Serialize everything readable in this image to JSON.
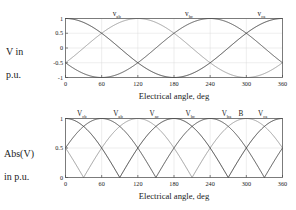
{
  "figure": {
    "background": "#ffffff",
    "panels": [
      "top",
      "bottom"
    ]
  },
  "top_panel": {
    "ylabel_line1": "V in",
    "ylabel_line2": "p.u.",
    "xlabel": "Electrical angle, deg",
    "curve_labels": [
      {
        "base": "v",
        "sub": "ab",
        "x_deg": 85
      },
      {
        "base": "v",
        "sub": "bc",
        "x_deg": 205
      },
      {
        "base": "v",
        "sub": "ca",
        "x_deg": 325
      }
    ]
  },
  "bottom_panel": {
    "ylabel_line1": "Abs(V)",
    "ylabel_line2": "in p.u.",
    "xlabel": "Electrical angle, deg",
    "curve_labels": [
      {
        "base": "V",
        "sub": "cb",
        "x_deg": 27
      },
      {
        "base": "V",
        "sub": "ab",
        "x_deg": 87
      },
      {
        "base": "V",
        "sub": "ac",
        "x_deg": 147
      },
      {
        "base": "V",
        "sub": "bc",
        "x_deg": 207
      },
      {
        "base": "V",
        "sub": "ba",
        "x_deg": 267
      },
      {
        "base": "B",
        "sub": "",
        "x_deg": 291
      },
      {
        "base": "V",
        "sub": "ca",
        "x_deg": 327
      }
    ]
  },
  "chart_data": [
    {
      "type": "line",
      "panel": "top",
      "title": "",
      "xlabel": "Electrical angle, deg",
      "ylabel": "V in p.u.",
      "xlim": [
        0,
        360
      ],
      "ylim": [
        -1,
        1
      ],
      "xticks": [
        0,
        60,
        120,
        180,
        240,
        300,
        360
      ],
      "xticklabels": [
        "0",
        "60",
        "120",
        "180",
        "240",
        "300",
        "360"
      ],
      "yticks": [
        -1,
        -0.5,
        0,
        0.5,
        1
      ],
      "yticklabels": [
        "-1",
        "-0.5",
        "0",
        "0.5",
        "1"
      ],
      "grid": true,
      "legend": "inline-curve-labels",
      "series": [
        {
          "name": "v_ab",
          "color": "#9a9a9a",
          "form": "sin(x-30)",
          "amplitude": 1,
          "phase_deg": -30,
          "peak_deg": 120,
          "value_at_0": -0.5
        },
        {
          "name": "v_bc",
          "color": "#4d4d4d",
          "form": "sin(x-150)",
          "amplitude": 1,
          "phase_deg": -150,
          "peak_deg": 240,
          "value_at_0": -0.866
        },
        {
          "name": "v_ca",
          "color": "#3a3a3a",
          "form": "sin(x+90)",
          "amplitude": 1,
          "phase_deg": 90,
          "peak_deg": 0,
          "value_at_0": 0.866
        }
      ]
    },
    {
      "type": "line",
      "panel": "bottom",
      "title": "",
      "xlabel": "Electrical angle, deg",
      "ylabel": "Abs(V) in p.u.",
      "xlim": [
        0,
        360
      ],
      "ylim": [
        0,
        1
      ],
      "xticks": [
        0,
        60,
        120,
        180,
        240,
        300,
        360
      ],
      "xticklabels": [
        "0",
        "60",
        "120",
        "180",
        "240",
        "300",
        "360"
      ],
      "yticks": [
        0,
        0.5,
        1
      ],
      "yticklabels": [
        "0",
        "0.5",
        "1"
      ],
      "grid": true,
      "legend": "inline-curve-labels",
      "series": [
        {
          "name": "|v_ab|",
          "color": "#9a9a9a",
          "form": "abs(sin(x-30))",
          "amplitude": 1,
          "phase_deg": -30,
          "zeros_deg": [
            30,
            210
          ],
          "peaks_deg": [
            120,
            300
          ]
        },
        {
          "name": "|v_bc|",
          "color": "#4d4d4d",
          "form": "abs(sin(x-150))",
          "amplitude": 1,
          "phase_deg": -150,
          "zeros_deg": [
            150,
            330
          ],
          "peaks_deg": [
            60,
            240
          ]
        },
        {
          "name": "|v_ca|",
          "color": "#3a3a3a",
          "form": "abs(sin(x+90))",
          "amplitude": 1,
          "phase_deg": 90,
          "zeros_deg": [
            90,
            270
          ],
          "peaks_deg": [
            0,
            180,
            360
          ]
        }
      ]
    }
  ]
}
